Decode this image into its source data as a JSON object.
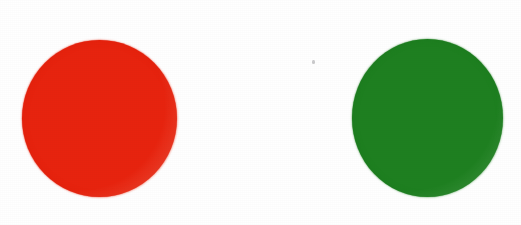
{
  "canvas": {
    "width": 521,
    "height": 225,
    "background_color": "#ffffff",
    "description": "Two solid filled circles on a plain white background"
  },
  "shapes": [
    {
      "name": "red-circle",
      "label": "Red circle",
      "color": "#e8230e",
      "color_name": "red",
      "center_x": 99,
      "center_y": 118,
      "diameter": 156,
      "left": 22,
      "top": 40,
      "width": 155,
      "height": 157
    },
    {
      "name": "green-circle",
      "label": "Green circle",
      "color": "#1e8020",
      "color_name": "green",
      "center_x": 427,
      "center_y": 118,
      "diameter": 154,
      "left": 352,
      "top": 39,
      "width": 151,
      "height": 158
    }
  ],
  "artifacts": {
    "speck": {
      "name": "scan-speck",
      "label": "Small grey speck",
      "color": "#8c8c91",
      "x": 312,
      "y": 60,
      "width": 3,
      "height": 4
    }
  }
}
